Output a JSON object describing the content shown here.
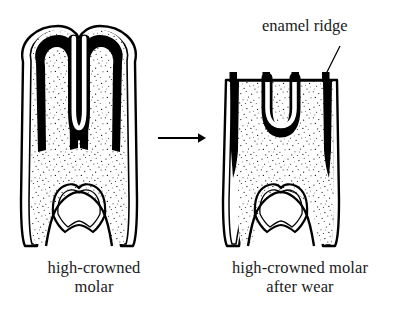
{
  "figure": {
    "type": "scientific-line-drawing",
    "background_color": "#ffffff",
    "ink_color": "#000000",
    "text_color": "#1a1a1a"
  },
  "annotations": {
    "enamel_ridge": {
      "label": "enamel ridge",
      "leader_line": {
        "from_x": 340,
        "from_y": 46,
        "to_x": 322,
        "to_y": 80
      }
    }
  },
  "captions": {
    "left": "high-crowned\nmolar",
    "right": "high-crowned molar\nafter wear"
  },
  "arrow": {
    "name": "transformation-arrow",
    "direction": "right",
    "x1": 158,
    "y1": 138,
    "x2": 204,
    "y2": 138
  },
  "teeth": [
    {
      "id": "unworn-molar",
      "name": "high-crowned molar (unworn)",
      "bbox": {
        "x": 20,
        "y": 26,
        "width": 118,
        "height": 221
      },
      "features": {
        "crown_top": "two rounded cusps with wavy outline",
        "enamel_band": "thick black enamel follows outline and deep central infold",
        "infold": "deep U-shaped enamel infold descending to mid-crown",
        "dentine": "stippled interior",
        "pulp_cavity": "arched outline near root with wavy base",
        "root_base": "open split root"
      }
    },
    {
      "id": "worn-molar",
      "name": "high-crowned molar after wear",
      "bbox": {
        "x": 222,
        "y": 74,
        "width": 118,
        "height": 173
      },
      "features": {
        "crown_top": "flat worn occlusal surface",
        "enamel_ridges": 4,
        "enamel_ridge_x_positions": [
          233,
          263,
          292,
          322
        ],
        "infold": "shallow U-shaped enamel infold remaining between middle ridges",
        "dentine": "stippled interior",
        "pulp_cavity": "arched outline near root with wavy base",
        "root_base": "open split root"
      }
    }
  ]
}
